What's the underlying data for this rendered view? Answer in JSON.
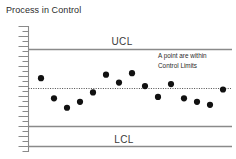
{
  "chart_data": {
    "type": "scatter",
    "title": "Process in Control",
    "xlabel": "",
    "ylabel": "",
    "grid": false,
    "legend_position": "none",
    "x": [
      1,
      2,
      3,
      4,
      5,
      6,
      7,
      8,
      9,
      10,
      11,
      12,
      13,
      14,
      15
    ],
    "values": [
      11.2,
      7.1,
      5.2,
      6.4,
      8.3,
      11.9,
      10.3,
      12.2,
      9.6,
      7.4,
      10.0,
      7.1,
      6.4,
      5.8,
      8.9
    ],
    "series": [
      {
        "name": "Sample measurement",
        "values": [
          11.2,
          7.1,
          5.2,
          6.4,
          8.3,
          11.9,
          10.3,
          12.2,
          9.6,
          7.4,
          10.0,
          7.1,
          6.4,
          5.8,
          8.9
        ]
      }
    ],
    "ylim": [
      0,
      20
    ],
    "xlim": [
      0,
      16
    ],
    "reference_lines": [
      {
        "name": "UCL",
        "label": "UCL",
        "value": 17.0,
        "style": "solid"
      },
      {
        "name": "center-line",
        "label": "",
        "value": 8.6,
        "style": "dotted"
      },
      {
        "name": "LCL",
        "label": "LCL",
        "value": 1.4,
        "style": "solid"
      }
    ],
    "annotations": [
      {
        "name": "points-within-limits-note",
        "line1": "A point are within",
        "line2": "Control Limits"
      }
    ],
    "axis": {
      "tick_count": 26,
      "ticks_labeled": false
    },
    "colors": {
      "point": "#111111",
      "line": "#878787",
      "center_line": "#4d4d4d",
      "text": "#2b2b2b",
      "background": "#ffffff"
    }
  },
  "labels": {
    "ucl": "UCL",
    "lcl": "LCL",
    "note_line1": "A point are within",
    "note_line2": "Control Limits"
  }
}
